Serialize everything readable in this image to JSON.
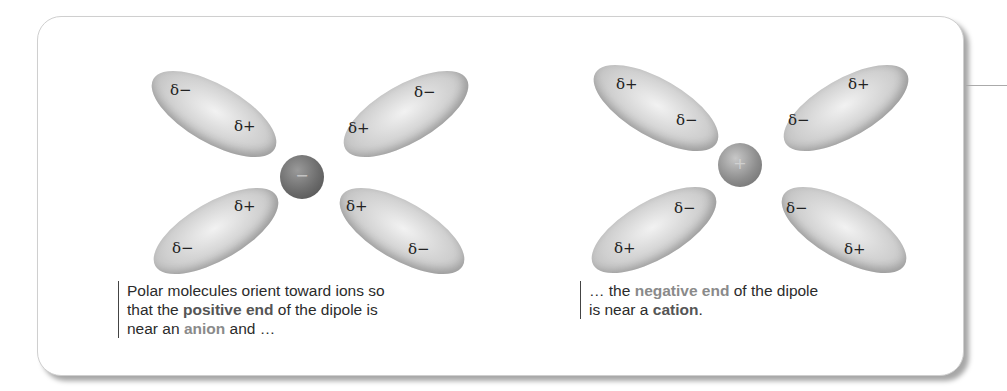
{
  "left_panel": {
    "ion": {
      "type": "anion",
      "sign": "−"
    },
    "dipoles": [
      {
        "position": "top-left",
        "outer_label": "δ−",
        "inner_label": "δ+"
      },
      {
        "position": "top-right",
        "outer_label": "δ−",
        "inner_label": "δ+"
      },
      {
        "position": "bottom-left",
        "outer_label": "δ−",
        "inner_label": "δ+"
      },
      {
        "position": "bottom-right",
        "outer_label": "δ−",
        "inner_label": "δ+"
      }
    ],
    "caption": {
      "line1": "Polar molecules orient toward ions so",
      "line2_pre": "that the ",
      "line2_highlight": "positive end",
      "line2_post": " of the dipole is",
      "line3_pre": "near an ",
      "line3_highlight": "anion",
      "line3_post": " and …"
    }
  },
  "right_panel": {
    "ion": {
      "type": "cation",
      "sign": "+"
    },
    "dipoles": [
      {
        "position": "top-left",
        "outer_label": "δ+",
        "inner_label": "δ−"
      },
      {
        "position": "top-right",
        "outer_label": "δ+",
        "inner_label": "δ−"
      },
      {
        "position": "bottom-left",
        "outer_label": "δ+",
        "inner_label": "δ−"
      },
      {
        "position": "bottom-right",
        "outer_label": "δ+",
        "inner_label": "δ−"
      }
    ],
    "caption": {
      "line1_pre": "… the ",
      "line1_highlight": "negative end",
      "line1_post": " of the dipole",
      "line2_pre": "is near a ",
      "line2_highlight": "cation",
      "line2_post": "."
    }
  },
  "colors": {
    "highlight_text": "#8a8a8a",
    "body_text": "#2b2b2b",
    "dipole_fill": "#cfcfcf",
    "anion_fill": "#6c6c6c",
    "cation_fill": "#8e8e8e"
  }
}
